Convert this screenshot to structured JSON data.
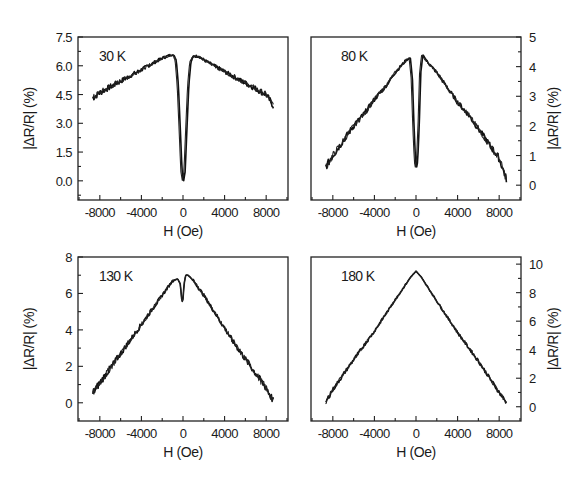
{
  "chart_data": [
    {
      "type": "line",
      "panel": "top-left",
      "title": "30 K",
      "xlabel": "H (Oe)",
      "ylabel": "|ΔR/R| (%)",
      "ylabel_side": "left",
      "xlim": [
        -10100,
        10100
      ],
      "ylim": [
        -1.0,
        7.5
      ],
      "xticks": [
        -8000,
        -4000,
        0,
        4000,
        8000
      ],
      "xtick_labels": [
        "-8000",
        "-4000",
        "0",
        "4000",
        "8000"
      ],
      "yticks": [
        0.0,
        1.5,
        3.0,
        4.5,
        6.0,
        7.5
      ],
      "ytick_labels": [
        "0.0",
        "1.5",
        "3.0",
        "4.5",
        "6.0",
        "7.5"
      ],
      "grid": false,
      "series": [
        {
          "name": "30 K",
          "x": [
            -8700,
            -8000,
            -7000,
            -6000,
            -5000,
            -4000,
            -3000,
            -2000,
            -1500,
            -1000,
            -700,
            -500,
            -300,
            -150,
            0,
            150,
            300,
            500,
            700,
            1000,
            1500,
            2000,
            3000,
            4000,
            5000,
            6000,
            7000,
            8000,
            8700
          ],
          "y": [
            4.3,
            4.6,
            4.9,
            5.2,
            5.5,
            5.8,
            6.1,
            6.4,
            6.5,
            6.6,
            6.3,
            5.0,
            2.5,
            0.5,
            0.0,
            0.5,
            2.5,
            5.0,
            6.2,
            6.5,
            6.5,
            6.3,
            6.0,
            5.7,
            5.4,
            5.1,
            4.8,
            4.5,
            3.9
          ]
        }
      ]
    },
    {
      "type": "line",
      "panel": "top-right",
      "title": "80 K",
      "xlabel": "H (Oe)",
      "ylabel": "|ΔR/R| (%)",
      "ylabel_side": "right",
      "xlim": [
        -10100,
        10100
      ],
      "ylim": [
        -0.5,
        5
      ],
      "xticks": [
        -8000,
        -4000,
        0,
        4000,
        8000
      ],
      "xtick_labels": [
        "-8000",
        "-4000",
        "0",
        "4000",
        "8000"
      ],
      "yticks": [
        0,
        1,
        2,
        3,
        4,
        5
      ],
      "ytick_labels": [
        "0",
        "1",
        "2",
        "3",
        "4",
        "5"
      ],
      "grid": false,
      "series": [
        {
          "name": "80 K",
          "x": [
            -8700,
            -8000,
            -7000,
            -6000,
            -5000,
            -4000,
            -3000,
            -2000,
            -1000,
            -600,
            -400,
            -250,
            -100,
            0,
            100,
            250,
            400,
            600,
            1000,
            2000,
            3000,
            4000,
            5000,
            6000,
            7000,
            8000,
            8700
          ],
          "y": [
            0.6,
            1.0,
            1.5,
            2.0,
            2.4,
            2.9,
            3.3,
            3.8,
            4.2,
            4.3,
            3.6,
            2.0,
            0.8,
            0.6,
            0.8,
            2.0,
            3.8,
            4.4,
            4.2,
            3.8,
            3.3,
            2.8,
            2.4,
            1.9,
            1.4,
            0.9,
            0.2
          ]
        }
      ]
    },
    {
      "type": "line",
      "panel": "bottom-left",
      "title": "130 K",
      "xlabel": "H (Oe)",
      "ylabel": "|ΔR/R| (%)",
      "ylabel_side": "left",
      "xlim": [
        -10100,
        10100
      ],
      "ylim": [
        -1,
        8
      ],
      "xticks": [
        -8000,
        -4000,
        0,
        4000,
        8000
      ],
      "xtick_labels": [
        "-8000",
        "-4000",
        "0",
        "4000",
        "8000"
      ],
      "yticks": [
        0,
        2,
        4,
        6,
        8
      ],
      "ytick_labels": [
        "0",
        "2",
        "4",
        "6",
        "8"
      ],
      "grid": false,
      "series": [
        {
          "name": "130 K",
          "x": [
            -8700,
            -8000,
            -7000,
            -6000,
            -5000,
            -4000,
            -3000,
            -2000,
            -1000,
            -500,
            -250,
            -100,
            0,
            100,
            250,
            500,
            1000,
            2000,
            3000,
            4000,
            5000,
            6000,
            7000,
            8000,
            8700
          ],
          "y": [
            0.5,
            1.1,
            1.9,
            2.7,
            3.5,
            4.3,
            5.1,
            5.9,
            6.7,
            6.8,
            6.5,
            5.5,
            5.7,
            6.5,
            7.0,
            7.0,
            6.7,
            5.9,
            5.0,
            4.1,
            3.2,
            2.4,
            1.6,
            0.8,
            0.1
          ]
        }
      ]
    },
    {
      "type": "line",
      "panel": "bottom-right",
      "title": "180 K",
      "xlabel": "H (Oe)",
      "ylabel": "|ΔR/R| (%)",
      "ylabel_side": "right",
      "xlim": [
        -10100,
        10100
      ],
      "ylim": [
        -1,
        10.5
      ],
      "xticks": [
        -8000,
        -4000,
        0,
        4000,
        8000
      ],
      "xtick_labels": [
        "-8000",
        "-4000",
        "0",
        "4000",
        "8000"
      ],
      "yticks": [
        0,
        2,
        4,
        6,
        8,
        10
      ],
      "ytick_labels": [
        "0",
        "2",
        "4",
        "6",
        "8",
        "10"
      ],
      "grid": false,
      "series": [
        {
          "name": "180 K",
          "x": [
            -8700,
            -8000,
            -6000,
            -4000,
            -2000,
            -500,
            0,
            500,
            2000,
            4000,
            6000,
            8000,
            8700
          ],
          "y": [
            0.3,
            1.2,
            3.3,
            5.3,
            7.5,
            9.1,
            9.5,
            9.1,
            7.4,
            5.2,
            3.2,
            1.0,
            0.3
          ]
        }
      ]
    }
  ]
}
